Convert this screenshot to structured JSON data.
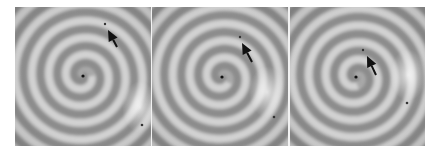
{
  "figure": {
    "panel_count": 3,
    "colors": {
      "background": "#ffffff",
      "band_light": "#d2d2d2",
      "band_dark": "#8c8c8c",
      "base": "#a8a8a8",
      "marker": "#111111"
    },
    "panels": [
      {
        "index": 1,
        "x": 15,
        "y": 7,
        "width": 137,
        "height": 139,
        "spiral_center": [
          68,
          69
        ],
        "turns": 5.5,
        "rotation": 0,
        "bright_patch": [
          125,
          100
        ],
        "small_dot": [
          90,
          17
        ],
        "arrow": {
          "tip": [
            93,
            23
          ],
          "tail": [
            102,
            40
          ]
        },
        "corner_dot": [
          127,
          118
        ]
      },
      {
        "index": 2,
        "x": 152,
        "y": 7,
        "width": 136,
        "height": 139,
        "spiral_center": [
          70,
          70
        ],
        "turns": 5.5,
        "rotation": 40,
        "bright_patch": [
          115,
          85
        ],
        "small_dot": [
          88,
          30
        ],
        "arrow": {
          "tip": [
            90,
            36
          ],
          "tail": [
            100,
            55
          ]
        },
        "corner_dot": [
          122,
          110
        ]
      },
      {
        "index": 3,
        "x": 290,
        "y": 7,
        "width": 135,
        "height": 139,
        "spiral_center": [
          66,
          70
        ],
        "turns": 5,
        "rotation": 80,
        "bright_patch": [
          118,
          68
        ],
        "small_dot": [
          73,
          43
        ],
        "arrow": {
          "tip": [
            77,
            49
          ],
          "tail": [
            86,
            68
          ]
        },
        "corner_dot": [
          117,
          96
        ]
      }
    ]
  }
}
